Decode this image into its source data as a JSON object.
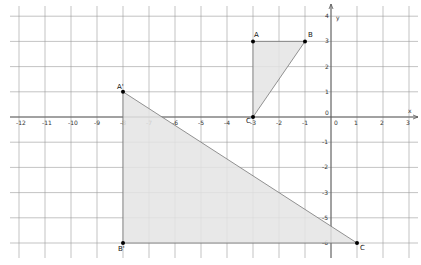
{
  "graph": {
    "x_axis_label": "x",
    "y_axis_label": "y",
    "x_ticks": [
      "-12",
      "-11",
      "-10",
      "-9",
      "-8",
      "-7",
      "-6",
      "-5",
      "-4",
      "-3",
      "-2",
      "-1",
      "0",
      "1",
      "2",
      "3"
    ],
    "y_ticks_pos": [
      "4",
      "3",
      "2",
      "1"
    ],
    "y_ticks_neg": [
      "-1",
      "-2",
      "-3",
      "-5",
      "-6"
    ],
    "origin_label": "0",
    "colors": {
      "grid": "#9a9a9a",
      "axis": "#555555",
      "fill": "#e4e4e4",
      "edge": "#777777",
      "point": "#000000"
    }
  },
  "shapes": {
    "triangle_ABC": {
      "points": [
        {
          "label": "A",
          "x": -3,
          "y": 3
        },
        {
          "label": "B",
          "x": -1,
          "y": 3
        },
        {
          "label": "C",
          "x": -3,
          "y": 0
        }
      ]
    },
    "triangle_A1B1C": {
      "points": [
        {
          "label": "A'",
          "x": -8,
          "y": 1
        },
        {
          "label": "B'",
          "x": -8,
          "y": -5
        },
        {
          "label": "C",
          "x": 1,
          "y": -5
        }
      ]
    }
  }
}
